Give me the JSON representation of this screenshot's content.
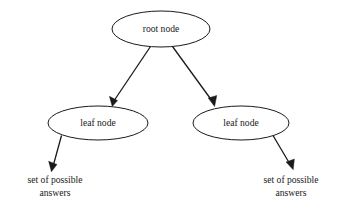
{
  "diagram": {
    "type": "tree-diagram",
    "background_color": "#ffffff",
    "stroke_color": "#1a1a1a",
    "text_color": "#1a1a1a",
    "nodes": {
      "root": {
        "label": "root node",
        "shape": "ellipse",
        "cx": 161,
        "cy": 29,
        "rx": 49,
        "ry": 18
      },
      "leaf_left": {
        "label": "leaf node",
        "shape": "ellipse",
        "cx": 98,
        "cy": 123,
        "rx": 50,
        "ry": 17
      },
      "leaf_right": {
        "label": "leaf node",
        "shape": "ellipse",
        "cx": 241,
        "cy": 123,
        "rx": 48,
        "ry": 17
      }
    },
    "answers_left": {
      "line1": "set of possible",
      "line2": "answers"
    },
    "answers_right": {
      "line1": "set of possible",
      "line2": "answers"
    },
    "edges": [
      {
        "name": "root-to-left-leaf",
        "from": "root",
        "to": "leaf_left"
      },
      {
        "name": "root-to-right-leaf",
        "from": "root",
        "to": "leaf_right"
      },
      {
        "name": "left-leaf-to-answers",
        "from": "leaf_left",
        "to": "answers_left"
      },
      {
        "name": "right-leaf-to-answers",
        "from": "leaf_right",
        "to": "answers_right"
      }
    ]
  }
}
